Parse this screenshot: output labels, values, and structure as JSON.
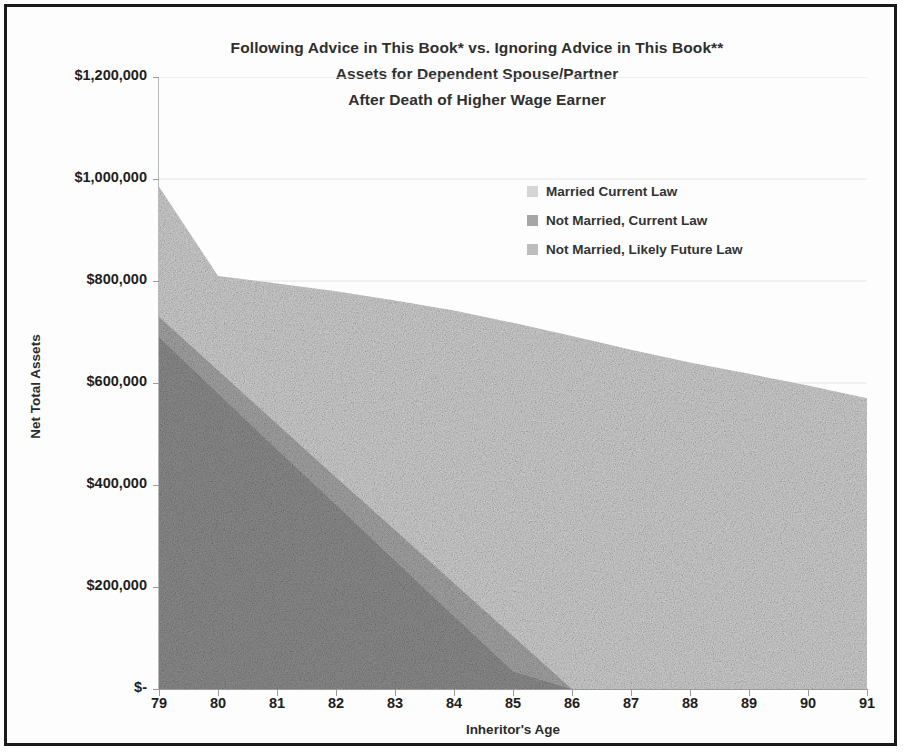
{
  "chart_data": {
    "type": "area",
    "title": "Following Advice in This Book* vs. Ignoring Advice in This Book**",
    "subtitle_line2": "Assets for Dependent Spouse/Partner",
    "subtitle_line3": "After Death of Higher Wage Earner",
    "xlabel": "Inheritor's Age",
    "ylabel": "Net Total Assets",
    "categories": [
      79,
      80,
      81,
      82,
      83,
      84,
      85,
      86,
      87,
      88,
      89,
      90,
      91
    ],
    "xtick_labels": [
      "79",
      "80",
      "81",
      "82",
      "83",
      "84",
      "85",
      "86",
      "87",
      "88",
      "89",
      "90",
      "91"
    ],
    "ytick_labels": [
      "$1,200,000",
      "$1,000,000",
      "$800,000",
      "$600,000",
      "$400,000",
      "$200,000",
      "$-"
    ],
    "ytick_values": [
      1200000,
      1000000,
      800000,
      600000,
      400000,
      200000,
      0
    ],
    "ylim": [
      0,
      1200000
    ],
    "xlim": [
      79,
      91
    ],
    "grid": true,
    "legend_position": "inside-upper-right",
    "stacked": false,
    "series": [
      {
        "name": "Married Current Law",
        "color": "#d3d3d3",
        "values": [
          985000,
          810000,
          795000,
          780000,
          762000,
          742000,
          718000,
          692000,
          665000,
          640000,
          618000,
          595000,
          570000
        ]
      },
      {
        "name": "Not Married, Current Law",
        "color": "#a8a8a8",
        "values": [
          730000,
          625000,
          520000,
          415000,
          312000,
          208000,
          104000,
          0,
          0,
          0,
          0,
          0,
          0
        ]
      },
      {
        "name": "Not Married, Likely Future Law",
        "color": "#8f8f8f",
        "values": [
          690000,
          580000,
          470000,
          362000,
          252000,
          143000,
          35000,
          0,
          0,
          0,
          0,
          0,
          0
        ]
      }
    ]
  },
  "legend": {
    "items": [
      {
        "label": "Married Current Law",
        "color": "#d5d5d5"
      },
      {
        "label": "Not Married, Current Law",
        "color": "#a6a6a6"
      },
      {
        "label": "Not Married, Likely Future Law",
        "color": "#bdbdbd"
      }
    ]
  }
}
